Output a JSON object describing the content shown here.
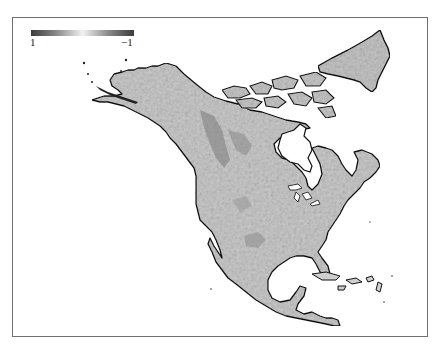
{
  "figure": {
    "type": "grayscale raster map",
    "region": "North America",
    "background": "#ffffff",
    "frame_color": "#6e6e6e",
    "coastline_color": "#111111",
    "land_shade_light": "#d9d9d9",
    "land_shade_dark": "#8c8c8c",
    "water_color": "#ffffff"
  },
  "legend": {
    "type": "colorbar",
    "orientation": "horizontal",
    "gradient": [
      "#3a3a3a",
      "#8a8a8a",
      "#f2f2f2",
      "#8a8a8a",
      "#3a3a3a"
    ],
    "min_label": "1",
    "max_label": "−1"
  }
}
